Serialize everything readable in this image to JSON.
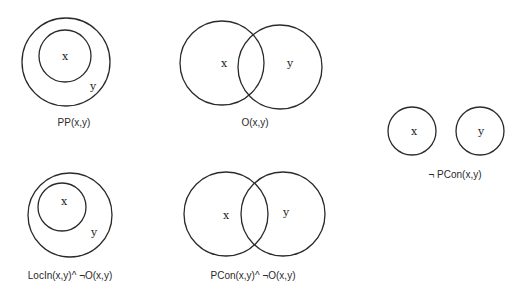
{
  "diagrams": [
    {
      "id": "pp",
      "caption": "PP(x,y)",
      "relation": "x is a proper part of y",
      "regions": [
        {
          "label": "y",
          "cx": 66,
          "cy": 62,
          "r": 44
        },
        {
          "label": "x",
          "cx": 65,
          "cy": 56,
          "r": 26
        }
      ],
      "label_positions": {
        "x": [
          65,
          60
        ],
        "y": [
          93,
          90
        ]
      },
      "caption_pos": [
        74,
        126
      ]
    },
    {
      "id": "o",
      "caption": "O(x,y)",
      "relation": "x overlaps y",
      "regions": [
        {
          "label": "x",
          "cx": 222,
          "cy": 63,
          "r": 42
        },
        {
          "label": "y",
          "cx": 280,
          "cy": 67,
          "r": 42
        }
      ],
      "label_positions": {
        "x": [
          224,
          67
        ],
        "y": [
          290,
          67
        ]
      },
      "caption_pos": [
        255,
        126
      ]
    },
    {
      "id": "not-pcon",
      "caption": "¬ PCon(x,y)",
      "relation": "x and y are not connected",
      "regions": [
        {
          "label": "x",
          "cx": 412,
          "cy": 131,
          "r": 24
        },
        {
          "label": "y",
          "cx": 480,
          "cy": 131,
          "r": 24
        }
      ],
      "label_positions": {
        "x": [
          414,
          135
        ],
        "y": [
          481,
          135
        ]
      },
      "caption_pos": [
        455,
        178
      ]
    },
    {
      "id": "locin",
      "caption": "LocIn(x,y)^ ¬O(x,y)",
      "relation": "x is located in y and x does not overlap y",
      "regions": [
        {
          "label": "y",
          "cx": 70,
          "cy": 215,
          "r": 42
        },
        {
          "label": "x",
          "cx": 62,
          "cy": 207,
          "r": 24
        }
      ],
      "label_positions": {
        "x": [
          64,
          205
        ],
        "y": [
          94,
          236
        ]
      },
      "caption_pos": [
        70,
        279
      ]
    },
    {
      "id": "pcon-not-o",
      "caption": "PCon(x,y)^ ¬O(x,y)",
      "relation": "x is partially connected to y and x does not overlap y",
      "regions": [
        {
          "label": "x",
          "cx": 226,
          "cy": 214,
          "r": 42
        },
        {
          "label": "y",
          "cx": 283,
          "cy": 214,
          "r": 42
        }
      ],
      "label_positions": {
        "x": [
          226,
          219
        ],
        "y": [
          286,
          216
        ]
      },
      "caption_pos": [
        253,
        279
      ]
    }
  ],
  "colors": {
    "stroke": "#2a2a2a",
    "text": "#222222",
    "background": "#ffffff"
  }
}
